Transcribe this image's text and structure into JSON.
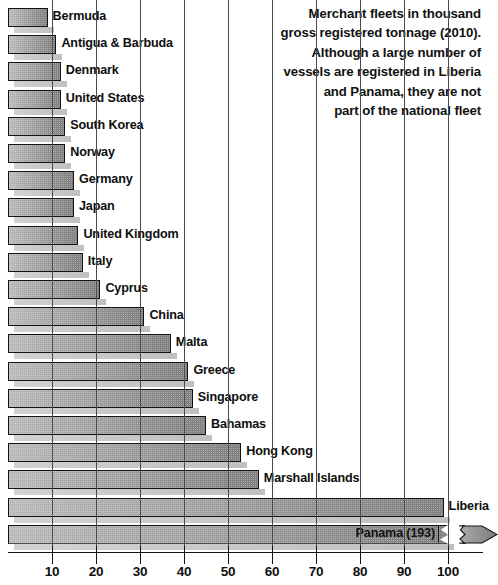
{
  "chart_data": {
    "type": "bar",
    "orientation": "horizontal",
    "title": "Merchant fleets in thousand\ngross registered tonnage (2010).\nAlthough a large number of\nvessels are registered in Liberia\nand Panama, they are not\npart of the national fleet",
    "xlabel": "",
    "ylabel": "",
    "xlim": [
      0,
      107
    ],
    "grid": true,
    "legend": null,
    "axis_ticks": [
      10,
      20,
      30,
      40,
      50,
      60,
      70,
      80,
      90,
      100
    ],
    "axis_tick_labels": [
      "10",
      "20",
      "30",
      "40",
      "50",
      "60",
      "70",
      "80",
      "90",
      "100"
    ],
    "note": "Panama bar is drawn with a broken axis because its value exceeds the axis maximum",
    "categories": [
      "Bermuda",
      "Antigua & Barbuda",
      "Denmark",
      "United States",
      "South Korea",
      "Norway",
      "Germany",
      "Japan",
      "United Kingdom",
      "Italy",
      "Cyprus",
      "China",
      "Malta",
      "Greece",
      "Singapore",
      "Bahamas",
      "Hong Kong",
      "Marshall Islands",
      "Liberia",
      "Panama"
    ],
    "values": [
      9,
      11,
      12,
      12,
      13,
      13,
      15,
      15,
      16,
      17,
      21,
      31,
      37,
      41,
      42,
      45,
      53,
      57,
      99,
      193
    ],
    "bars": [
      {
        "label": "Bermuda",
        "value": 9,
        "display": "Bermuda",
        "truncated": false,
        "label_inside": false
      },
      {
        "label": "Antigua & Barbuda",
        "value": 11,
        "display": "Antigua & Barbuda",
        "truncated": false,
        "label_inside": false
      },
      {
        "label": "Denmark",
        "value": 12,
        "display": "Denmark",
        "truncated": false,
        "label_inside": false
      },
      {
        "label": "United States",
        "value": 12,
        "display": "United States",
        "truncated": false,
        "label_inside": false
      },
      {
        "label": "South Korea",
        "value": 13,
        "display": "South Korea",
        "truncated": false,
        "label_inside": false
      },
      {
        "label": "Norway",
        "value": 13,
        "display": "Norway",
        "truncated": false,
        "label_inside": false
      },
      {
        "label": "Germany",
        "value": 15,
        "display": "Germany",
        "truncated": false,
        "label_inside": false
      },
      {
        "label": "Japan",
        "value": 15,
        "display": "Japan",
        "truncated": false,
        "label_inside": false
      },
      {
        "label": "United Kingdom",
        "value": 16,
        "display": "United Kingdom",
        "truncated": false,
        "label_inside": false
      },
      {
        "label": "Italy",
        "value": 17,
        "display": "Italy",
        "truncated": false,
        "label_inside": false
      },
      {
        "label": "Cyprus",
        "value": 21,
        "display": "Cyprus",
        "truncated": false,
        "label_inside": false
      },
      {
        "label": "China",
        "value": 31,
        "display": "China",
        "truncated": false,
        "label_inside": false
      },
      {
        "label": "Malta",
        "value": 37,
        "display": "Malta",
        "truncated": false,
        "label_inside": false
      },
      {
        "label": "Greece",
        "value": 41,
        "display": "Greece",
        "truncated": false,
        "label_inside": false
      },
      {
        "label": "Singapore",
        "value": 42,
        "display": "Singapore",
        "truncated": false,
        "label_inside": false
      },
      {
        "label": "Bahamas",
        "value": 45,
        "display": "Bahamas",
        "truncated": false,
        "label_inside": false
      },
      {
        "label": "Hong Kong",
        "value": 53,
        "display": "Hong Kong",
        "truncated": false,
        "label_inside": false
      },
      {
        "label": "Marshall Islands",
        "value": 57,
        "display": "Marshall Islands",
        "truncated": false,
        "label_inside": false
      },
      {
        "label": "Liberia",
        "value": 99,
        "display": "Liberia",
        "truncated": false,
        "label_inside": false
      },
      {
        "label": "Panama",
        "value": 193,
        "display": "Panama (193)",
        "truncated": true,
        "label_inside": true
      }
    ]
  },
  "colors": {
    "bar_light": "#b9b9b9",
    "bar_dark": "#7f7f7f",
    "bar_outline": "#121212",
    "shadow": "#c9c9c9",
    "text": "#101010",
    "axis": "#141414",
    "background": "#ffffff"
  }
}
